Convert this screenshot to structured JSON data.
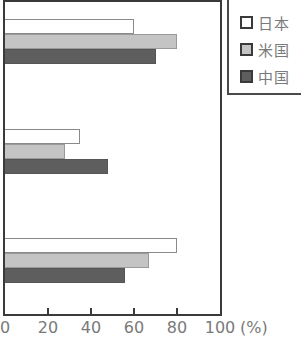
{
  "chart_data": {
    "type": "bar",
    "orientation": "horizontal",
    "title": "",
    "xlabel": "(%)",
    "ylabel": "",
    "xlim": [
      0,
      100
    ],
    "xticks": [
      0,
      20,
      40,
      60,
      80,
      100
    ],
    "xtick_labels": [
      "0",
      "20",
      "40",
      "60",
      "80",
      "100"
    ],
    "unit_label": "(%)",
    "categories": [
      "",
      "",
      ""
    ],
    "series": [
      {
        "name": "日本",
        "color": "#ffffff",
        "values": [
          60,
          35,
          80
        ]
      },
      {
        "name": "米国",
        "color": "#c4c4c4",
        "values": [
          80,
          28,
          67
        ]
      },
      {
        "name": "中国",
        "color": "#5e5e5e",
        "values": [
          70,
          48,
          56
        ]
      }
    ],
    "grid": false,
    "legend_position": "top-right, outside plot"
  },
  "legend": {
    "items": [
      {
        "label": "日本",
        "color": "#ffffff"
      },
      {
        "label": "米国",
        "color": "#c4c4c4"
      },
      {
        "label": "中国",
        "color": "#5e5e5e"
      }
    ]
  },
  "axis": {
    "ticks": [
      "0",
      "20",
      "40",
      "60",
      "80",
      "100"
    ],
    "unit": "(%)"
  }
}
